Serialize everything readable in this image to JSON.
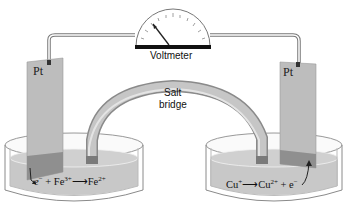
{
  "diagram": {
    "type": "galvanic-cell",
    "voltmeter": {
      "label": "Voltmeter"
    },
    "salt_bridge": {
      "label_line1": "Salt",
      "label_line2": "bridge"
    },
    "left_cell": {
      "electrode": "Pt",
      "reaction": {
        "lhs": "e",
        "lhs_sup": "−",
        "plus": "+ Fe",
        "ion1_sup": "3+",
        "arrow": "⟶",
        "product": "Fe",
        "product_sup": "2+"
      }
    },
    "right_cell": {
      "electrode": "Pt",
      "reaction": {
        "reactant": "Cu",
        "reactant_sup": "+",
        "arrow": "⟶",
        "product": "Cu",
        "product_sup": "2+",
        "plus": "+ e",
        "electron_sup": "−"
      }
    },
    "colors": {
      "solution": "#c8c8c8",
      "electrode": "#bdbdbd",
      "electrode_submerged": "#8f8f8f",
      "bridge": "#a9a9a9",
      "wire": "#555555",
      "beaker_outline": "#8a8a8a"
    }
  }
}
